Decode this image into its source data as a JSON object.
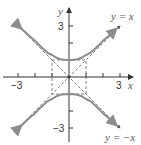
{
  "diagram": {
    "origin_px": [
      69,
      77
    ],
    "unit_px": 17,
    "axes": {
      "x_label": "x",
      "y_label": "y",
      "x_tick_labels": {
        "neg": "−3",
        "pos": "3"
      },
      "y_tick_labels": {
        "pos": "3",
        "neg": "−3"
      },
      "x_ticks": [
        -3,
        -2,
        -1,
        1,
        2,
        3
      ],
      "y_ticks": [
        -3,
        -2,
        -1,
        1,
        2,
        3
      ]
    },
    "asymptotes": [
      {
        "label": "y = x",
        "slope": 1
      },
      {
        "label": "y = −x",
        "slope": -1
      }
    ],
    "reference_box": {
      "x": [
        -1,
        1
      ],
      "y": [
        -1,
        1
      ],
      "style": "dashed"
    },
    "hyperbola": {
      "equation": "y^2 - x^2 = 1",
      "vertices": [
        [
          0,
          1
        ],
        [
          0,
          -1
        ]
      ],
      "x_range": [
        -2.8,
        2.8
      ]
    },
    "colors": {
      "axis": "#333333",
      "curve": "#8c8c8c",
      "dashed": "#666666",
      "label": "#555555"
    }
  }
}
